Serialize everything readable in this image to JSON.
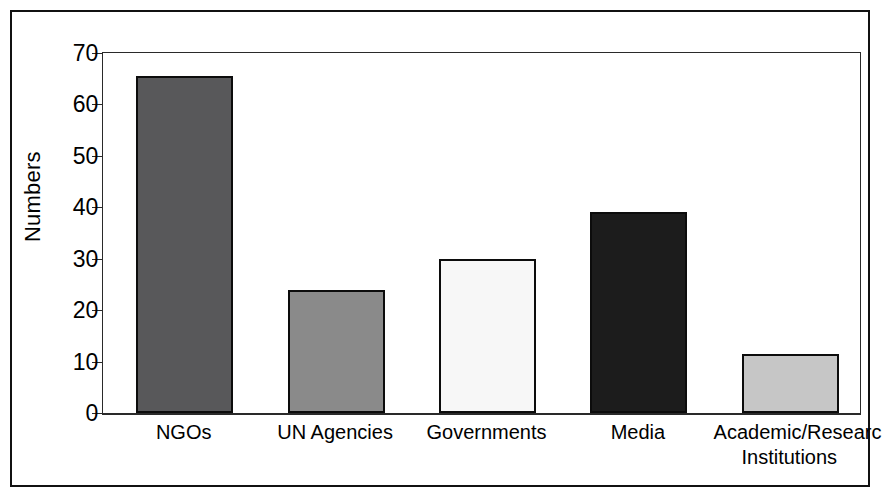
{
  "figure": {
    "frame_color": "#111111",
    "background": "#ffffff"
  },
  "chart_data": {
    "type": "bar",
    "title": "",
    "xlabel": "",
    "ylabel": "Numbers",
    "ylim": [
      0,
      70
    ],
    "ytick_step": 10,
    "yticks": [
      "0",
      "10",
      "20",
      "30",
      "40",
      "50",
      "60",
      "70"
    ],
    "grid": false,
    "legend": "none",
    "categories": [
      "NGOs",
      "UN Agencies",
      "Governments",
      "Media",
      "Academic/Research\nInstitutions"
    ],
    "values": [
      65.5,
      24,
      30,
      39,
      11.5
    ],
    "bar_colors": [
      "#58585a",
      "#8a8a8a",
      "#f7f7f7",
      "#1c1c1c",
      "#c6c6c6"
    ],
    "bar_edge_color": "#0c0c0c",
    "series": [
      {
        "name": "Numbers",
        "values": [
          65.5,
          24,
          30,
          39,
          11.5
        ]
      }
    ]
  },
  "axis": {
    "tick_color": "#2a2a2a",
    "axis_line_color": "#2a2a2a"
  }
}
